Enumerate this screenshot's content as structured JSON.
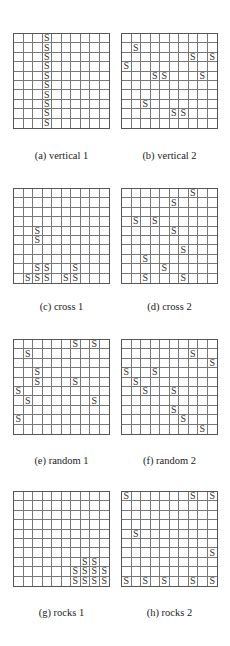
{
  "grid_size": 10,
  "symbol": "S",
  "colors": {
    "grid_line": "#777777",
    "border": "#555555",
    "symbol": "#333333"
  },
  "panels": [
    {
      "id": "a",
      "caption": "(a) vertical 1",
      "left": 13,
      "top": 33,
      "caption_top": 150,
      "cells": [
        [
          0,
          3
        ],
        [
          1,
          3
        ],
        [
          2,
          3
        ],
        [
          3,
          3
        ],
        [
          4,
          3
        ],
        [
          5,
          3
        ],
        [
          6,
          3
        ],
        [
          7,
          3
        ],
        [
          8,
          3
        ],
        [
          9,
          3
        ]
      ]
    },
    {
      "id": "b",
      "caption": "(b) vertical 2",
      "left": 121,
      "top": 33,
      "caption_top": 150,
      "cells": [
        [
          1,
          1
        ],
        [
          2,
          7
        ],
        [
          2,
          9
        ],
        [
          3,
          0
        ],
        [
          4,
          3
        ],
        [
          4,
          4
        ],
        [
          4,
          8
        ],
        [
          7,
          2
        ],
        [
          8,
          5
        ],
        [
          8,
          6
        ]
      ]
    },
    {
      "id": "c",
      "caption": "(c) cross 1",
      "left": 13,
      "top": 188,
      "caption_top": 301,
      "cells": [
        [
          4,
          2
        ],
        [
          5,
          2
        ],
        [
          8,
          2
        ],
        [
          8,
          3
        ],
        [
          8,
          6
        ],
        [
          9,
          1
        ],
        [
          9,
          2
        ],
        [
          9,
          3
        ],
        [
          9,
          5
        ],
        [
          9,
          6
        ]
      ]
    },
    {
      "id": "d",
      "caption": "(d) cross 2",
      "left": 121,
      "top": 188,
      "caption_top": 301,
      "cells": [
        [
          0,
          7
        ],
        [
          1,
          5
        ],
        [
          3,
          1
        ],
        [
          3,
          3
        ],
        [
          4,
          5
        ],
        [
          6,
          6
        ],
        [
          7,
          2
        ],
        [
          8,
          4
        ],
        [
          9,
          2
        ],
        [
          9,
          6
        ]
      ]
    },
    {
      "id": "e",
      "caption": "(e) random 1",
      "left": 13,
      "top": 339,
      "caption_top": 455,
      "cells": [
        [
          0,
          6
        ],
        [
          0,
          8
        ],
        [
          1,
          1
        ],
        [
          3,
          2
        ],
        [
          4,
          2
        ],
        [
          4,
          6
        ],
        [
          5,
          0
        ],
        [
          6,
          1
        ],
        [
          6,
          8
        ],
        [
          8,
          0
        ]
      ]
    },
    {
      "id": "f",
      "caption": "(f) random 2",
      "left": 121,
      "top": 339,
      "caption_top": 455,
      "cells": [
        [
          1,
          7
        ],
        [
          2,
          9
        ],
        [
          3,
          0
        ],
        [
          3,
          3
        ],
        [
          4,
          1
        ],
        [
          5,
          2
        ],
        [
          5,
          5
        ],
        [
          7,
          5
        ],
        [
          8,
          6
        ],
        [
          9,
          8
        ]
      ]
    },
    {
      "id": "g",
      "caption": "(g) rocks 1",
      "left": 13,
      "top": 491,
      "caption_top": 607,
      "cells": [
        [
          7,
          7
        ],
        [
          7,
          8
        ],
        [
          8,
          6
        ],
        [
          8,
          7
        ],
        [
          8,
          8
        ],
        [
          8,
          9
        ],
        [
          9,
          6
        ],
        [
          9,
          7
        ],
        [
          9,
          8
        ],
        [
          9,
          9
        ]
      ]
    },
    {
      "id": "h",
      "caption": "(h) rocks 2",
      "left": 121,
      "top": 491,
      "caption_top": 607,
      "cells": [
        [
          0,
          0
        ],
        [
          0,
          7
        ],
        [
          0,
          9
        ],
        [
          4,
          1
        ],
        [
          6,
          9
        ],
        [
          9,
          0
        ],
        [
          9,
          2
        ],
        [
          9,
          4
        ],
        [
          9,
          7
        ],
        [
          9,
          9
        ]
      ]
    }
  ]
}
